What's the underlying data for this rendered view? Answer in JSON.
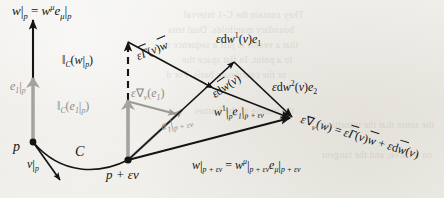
{
  "figure": {
    "name": "covariant-derivative-parallel-transport-diagram",
    "caption_text": "",
    "background_color": "#efeeea",
    "ink_color": "#141414",
    "gray_ink_color": "#8d8b86"
  },
  "points": {
    "p": "p",
    "p_plus_ev": "p + εv"
  },
  "curve": {
    "label": "C"
  },
  "labels": {
    "w_at_p": {
      "main": "w",
      "bar1": "|",
      "sub1": "p",
      "eq": " = ",
      "main2": "w",
      "sup2": "μ",
      "main3": "e",
      "sub3": "μ",
      "bar3": "|",
      "sub4": "p",
      "plain": "w|p = wμ eμ|p"
    },
    "v_at_p": {
      "main": "v",
      "bar": "|",
      "sub": "p",
      "plain": "v|p"
    },
    "e1_at_p": {
      "main": "e",
      "sub": "1",
      "bar": "|",
      "sub2": "p",
      "plain": "e1|p"
    },
    "transport_w": {
      "bars": "‖",
      "sub": "C",
      "open": "(",
      "main": "w",
      "bar": "|",
      "subp": "p",
      "close": ")",
      "plain": "‖C(w|p)"
    },
    "transport_e1": {
      "bars": "‖",
      "sub": "C",
      "open": "(",
      "main": "e",
      "sub1": "1",
      "bar": "|",
      "subp": "p",
      "close": ")",
      "plain": "‖C(e1|p)"
    },
    "eps_nabla_e1": {
      "eps": "ε",
      "nabla": "∇",
      "sub": "v",
      "open": "(",
      "main": "e",
      "sub1": "1",
      "close": ")",
      "plain": "ε∇v(e1)"
    },
    "e1_at_p_plus_ev": {
      "main": "e",
      "sub": "1",
      "bar": "|",
      "sub2": "p + εv",
      "plain": "e1|p+εv"
    },
    "eps_gamma_v_w": {
      "eps": "ε",
      "gamma": "Γ",
      "open": "(",
      "v": "v",
      "close": ")",
      "w": "w",
      "plain": "εΓ(v)w⃗"
    },
    "eps_dw1_v_e1": {
      "eps": "ε",
      "d": "d",
      "w": "w",
      "sup": "1",
      "open": "(",
      "v": "v",
      "close": ")",
      "e": "e",
      "sub": "1",
      "plain": "εdw¹(v)e₁"
    },
    "eps_dw2_v_e2": {
      "eps": "ε",
      "d": "d",
      "w": "w",
      "sup": "2",
      "open": "(",
      "v": "v",
      "close": ")",
      "e": "e",
      "sub": "2",
      "plain": "εdw²(v)e₂"
    },
    "eps_dw_vec_v": {
      "eps": "ε",
      "d": "d",
      "w": "w",
      "open": "(",
      "v": "v",
      "close": ")",
      "plain": "εdw⃗(v)"
    },
    "w_at_p_plus_ev": {
      "main": "w",
      "bar": "|",
      "sub": "p + εv",
      "eq": " = ",
      "main2": "w",
      "sup2": "μ",
      "bar2": "|",
      "sub2": "p + εv",
      "main3": "e",
      "sub3": "μ",
      "bar3": "|",
      "sub4": "p + εv",
      "plain": "w|p+εv = wμ|p+εv eμ|p+εv"
    },
    "main_equation": {
      "eps": "ε",
      "nabla": "∇",
      "sub": "v",
      "open": "(",
      "w": "w",
      "close": ")",
      "eq": " = ",
      "eps2": "ε",
      "gamma": "Γ",
      "open2": "(",
      "v2": "v",
      "close2": ")",
      "w2": "w",
      "plus": " + ",
      "eps3": "ε",
      "d": "d",
      "w3": "w",
      "open3": "(",
      "v3": "v",
      "close3": ")",
      "plain": "ε∇v(w) = εΓ(v)w⃗ + εdw⃗(v)"
    }
  },
  "bleed_through_text": [
    "They contain the C-1 interval",
    "boundary manifolds.  Dual tens",
    "that a vector is just a sequence o",
    "to a point. In flat space the",
    "or the coordinate basis.  For d",
    "the bundle of the frames",
    "the sense that the transition",
    "on a curve, and the tangent"
  ]
}
